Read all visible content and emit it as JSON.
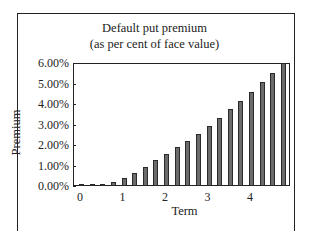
{
  "chart_data": {
    "type": "bar",
    "title": "Default put premium",
    "subtitle": "(as per cent of face value)",
    "xlabel": "Term",
    "ylabel": "Premium",
    "x_tick_labels": [
      "0",
      "1",
      "2",
      "3",
      "4"
    ],
    "y_tick_labels": [
      "0.00%",
      "1.00%",
      "2.00%",
      "3.00%",
      "4.00%",
      "5.00%",
      "6.00%"
    ],
    "ylim": [
      0,
      6
    ],
    "xlim": [
      0,
      5
    ],
    "grid": false,
    "legend": null,
    "categories": [
      0.25,
      0.5,
      0.75,
      1.0,
      1.25,
      1.5,
      1.75,
      2.0,
      2.25,
      2.5,
      2.75,
      3.0,
      3.25,
      3.5,
      3.75,
      4.0,
      4.25,
      4.5,
      4.75,
      5.0
    ],
    "values": [
      0.02,
      0.05,
      0.1,
      0.2,
      0.4,
      0.62,
      0.92,
      1.25,
      1.55,
      1.9,
      2.2,
      2.55,
      2.95,
      3.3,
      3.75,
      4.15,
      4.6,
      5.05,
      5.5,
      6.0
    ],
    "bar_color": "#6b6b6b"
  }
}
